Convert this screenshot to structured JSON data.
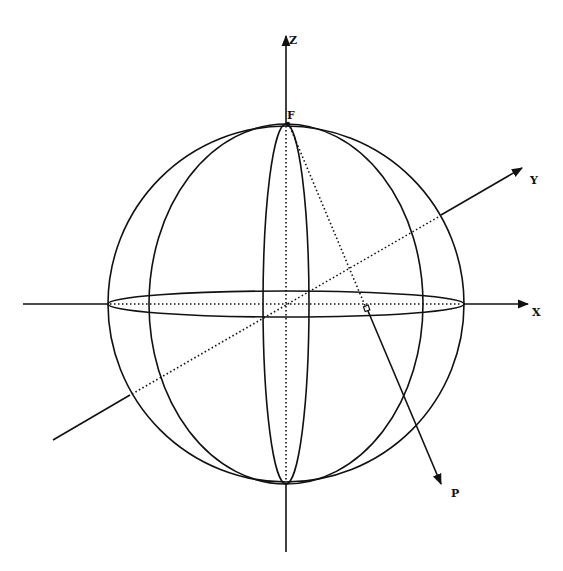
{
  "diagram": {
    "type": "3d-sphere-axes",
    "labels": {
      "z_axis": "Z",
      "y_axis": "Y",
      "x_axis": "X",
      "pole_point": "F",
      "projected_point": "P"
    },
    "colors": {
      "stroke": "#111111",
      "background": "#ffffff"
    }
  }
}
